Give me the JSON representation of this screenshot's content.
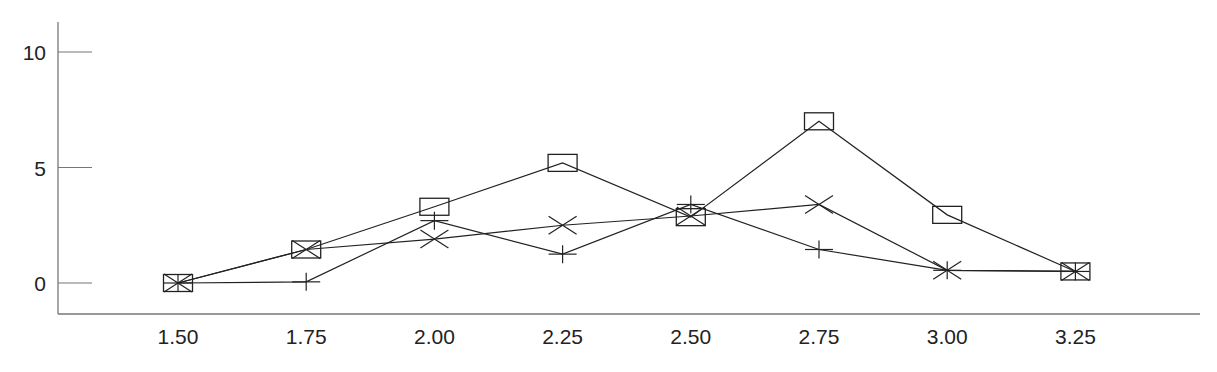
{
  "chart_data": {
    "type": "line",
    "title": "",
    "xlabel": "",
    "ylabel": "",
    "x": [
      1.5,
      1.75,
      2.0,
      2.25,
      2.5,
      2.75,
      3.0,
      3.25
    ],
    "x_tick_labels": [
      "1.50",
      "1.75",
      "2.00",
      "2.25",
      "2.50",
      "2.75",
      "3.00",
      "3.25"
    ],
    "y_ticks": [
      0,
      5,
      10
    ],
    "y_tick_labels": [
      "0",
      "5",
      "10"
    ],
    "ylim": [
      -1.3,
      11.3
    ],
    "grid": false,
    "legend": null,
    "series": [
      {
        "name": "square-marker series",
        "marker": "square",
        "values": [
          0,
          1.45,
          3.3,
          5.2,
          2.85,
          7.0,
          2.95,
          0.5
        ]
      },
      {
        "name": "x-marker series",
        "marker": "x",
        "values": [
          0,
          1.45,
          1.9,
          2.5,
          2.9,
          3.4,
          0.55,
          0.5
        ]
      },
      {
        "name": "plus-marker series",
        "marker": "plus",
        "values": [
          0,
          0.05,
          2.7,
          1.25,
          3.4,
          1.45,
          0.55,
          0.5
        ]
      }
    ],
    "colors": {
      "line": "#222222",
      "axis": "#777777",
      "text": "#222222"
    }
  }
}
